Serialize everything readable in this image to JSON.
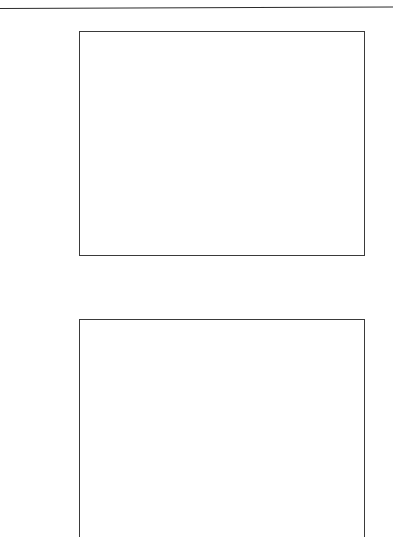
{
  "figure": {
    "rule_present": true
  },
  "chart_data": [
    {
      "type": "bar",
      "orientation": "horizontal",
      "panel": "top",
      "title": "",
      "xlabel": "Range (cm) relative to water",
      "ylabel": "",
      "xlim": [
        0.9,
        1.2
      ],
      "xticks": [
        "0.90",
        "0.95",
        "1.00",
        "1.05",
        "1.10",
        "1.15",
        "1.20"
      ],
      "xtick_values": [
        0.9,
        0.95,
        1.0,
        1.05,
        1.1,
        1.15,
        1.2
      ],
      "minor_tick_step": 0.01,
      "grid": "vertical",
      "legend": "none",
      "categories": [
        "WT1",
        "Gammex",
        "Rando",
        "Polystyrene",
        "Polysthylene",
        "PMMA",
        "A-150"
      ],
      "values": [
        1.0,
        1.025,
        0.994,
        1.037,
        1.001,
        1.166,
        1.136
      ],
      "bar_color": "#b9b9b9",
      "bar_edge_color": "#4a4a4a"
    },
    {
      "type": "bar",
      "orientation": "horizontal",
      "panel": "bottom",
      "title": "",
      "xlabel": "",
      "ylabel": "",
      "xlim": [
        0.9,
        1.2
      ],
      "xticks": [],
      "xtick_values": [
        0.95,
        1.0,
        1.05,
        1.1,
        1.15
      ],
      "grid": "vertical",
      "legend": "none",
      "categories": [
        "WT1",
        "Gammex",
        "Rando",
        "Polystyrene",
        "Polysthylene",
        "PMMA",
        "A-150"
      ],
      "values": [
        0.978,
        0.978,
        0.999,
        0.978,
        1.061,
        0.977,
        1.005
      ],
      "bar_color": "#b9b9b9",
      "bar_edge_color": "#4a4a4a",
      "clipped_at_image_bottom": true
    }
  ]
}
